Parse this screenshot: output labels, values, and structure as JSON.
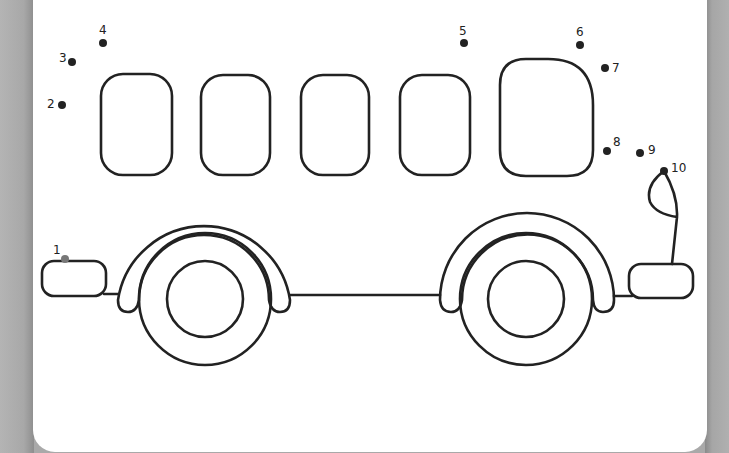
{
  "worksheet": {
    "subject": "bus",
    "line_color": "#222222",
    "dots": [
      {
        "n": "1",
        "x": 65,
        "y": 259,
        "lx": 53,
        "ly": 244,
        "color": "#777777"
      },
      {
        "n": "2",
        "x": 62,
        "y": 105,
        "lx": 47,
        "ly": 98,
        "color": "#222222"
      },
      {
        "n": "3",
        "x": 72,
        "y": 62,
        "lx": 59,
        "ly": 52,
        "color": "#222222"
      },
      {
        "n": "4",
        "x": 103,
        "y": 43,
        "lx": 99,
        "ly": 24,
        "color": "#222222"
      },
      {
        "n": "5",
        "x": 464,
        "y": 43,
        "lx": 459,
        "ly": 25,
        "color": "#222222"
      },
      {
        "n": "6",
        "x": 580,
        "y": 45,
        "lx": 576,
        "ly": 26,
        "color": "#222222"
      },
      {
        "n": "7",
        "x": 605,
        "y": 68,
        "lx": 612,
        "ly": 62,
        "color": "#222222"
      },
      {
        "n": "8",
        "x": 607,
        "y": 151,
        "lx": 613,
        "ly": 136,
        "color": "#222222"
      },
      {
        "n": "9",
        "x": 640,
        "y": 153,
        "lx": 648,
        "ly": 144,
        "color": "#222222"
      },
      {
        "n": "10",
        "x": 664,
        "y": 171,
        "lx": 671,
        "ly": 162,
        "color": "#222222"
      }
    ]
  }
}
